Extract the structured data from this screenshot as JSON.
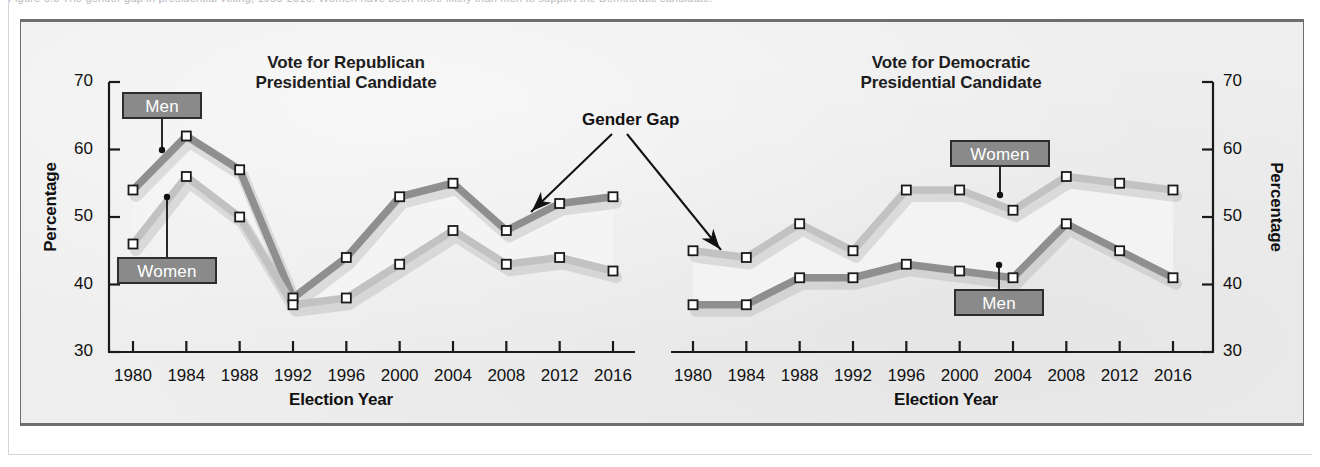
{
  "figure": {
    "background_color": "#eeeeee",
    "border_color": "#6e6e6e"
  },
  "series_colors": {
    "men_republican": "#8f8f8f",
    "women_republican": "#c2c2c2",
    "women_democratic": "#c2c2c2",
    "men_democratic": "#8f8f8f",
    "marker_fill": "#ffffff",
    "marker_stroke": "#1a1a1a",
    "callout_fill": "#8a8a8a",
    "callout_border": "#2d2d2d",
    "callout_text": "#ffffff",
    "text": "#111111"
  },
  "annotations": {
    "gender_gap_label": "Gender Gap",
    "men_label": "Men",
    "women_label": "Women"
  },
  "top_sliver_text": "Figure 6.3 The gender gap in presidential voting, 1980-2016. Women have been more likely than men to support the Democratic candidate.",
  "chart_data": [
    {
      "type": "line",
      "id": "republican",
      "title": "Vote for Republican\nPresidential Candidate",
      "title_line1": "Vote for Republican",
      "title_line2": "Presidential Candidate",
      "xlabel": "Election Year",
      "ylabel": "Percentage",
      "ylim": [
        30,
        70
      ],
      "yticks": [
        30,
        40,
        50,
        60,
        70
      ],
      "categories": [
        1980,
        1984,
        1988,
        1992,
        1996,
        2000,
        2004,
        2008,
        2012,
        2016
      ],
      "x_tick_labels": [
        "1980",
        "1984",
        "1988",
        "1992",
        "1996",
        "2000",
        "2004",
        "2008",
        "2012",
        "2016"
      ],
      "grid": false,
      "legend": "inline-callouts",
      "series": [
        {
          "name": "Men",
          "values": [
            54,
            62,
            57,
            38,
            44,
            53,
            55,
            48,
            52,
            53
          ]
        },
        {
          "name": "Women",
          "values": [
            46,
            56,
            50,
            37,
            38,
            43,
            48,
            43,
            44,
            42
          ]
        }
      ]
    },
    {
      "type": "line",
      "id": "democratic",
      "title": "Vote for Democratic\nPresidential Candidate",
      "title_line1": "Vote for Democratic",
      "title_line2": "Presidential Candidate",
      "xlabel": "Election Year",
      "ylabel": "Percentage",
      "ylim": [
        30,
        70
      ],
      "yticks": [
        30,
        40,
        50,
        60,
        70
      ],
      "categories": [
        1980,
        1984,
        1988,
        1992,
        1996,
        2000,
        2004,
        2008,
        2012,
        2016
      ],
      "x_tick_labels": [
        "1980",
        "1984",
        "1988",
        "1992",
        "1996",
        "2000",
        "2004",
        "2008",
        "2012",
        "2016"
      ],
      "grid": false,
      "legend": "inline-callouts",
      "series": [
        {
          "name": "Women",
          "values": [
            45,
            44,
            49,
            45,
            54,
            54,
            51,
            56,
            55,
            54
          ]
        },
        {
          "name": "Men",
          "values": [
            37,
            37,
            41,
            41,
            43,
            42,
            41,
            49,
            45,
            41
          ]
        }
      ]
    }
  ]
}
